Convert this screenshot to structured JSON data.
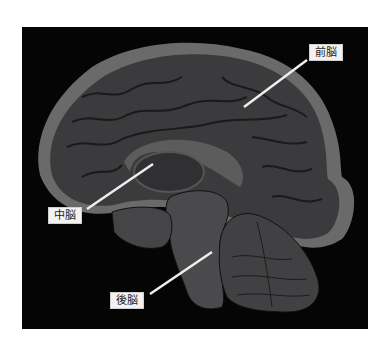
{
  "figure": {
    "type": "brain-midsagittal-section",
    "background_color": "#050505",
    "page_color": "#ffffff",
    "tissue_color_dark": "#3a3a3c",
    "tissue_color_light": "#6b6b6b",
    "leader_line_color": "#eeeeee"
  },
  "labels": [
    {
      "id": "forebrain",
      "text": "前脳"
    },
    {
      "id": "midbrain",
      "text": "中脳"
    },
    {
      "id": "hindbrain",
      "text": "後脳"
    }
  ]
}
